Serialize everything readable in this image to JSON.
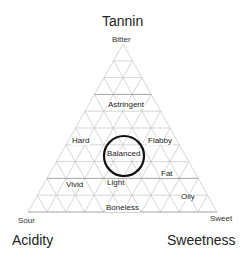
{
  "diagram": {
    "axes": {
      "top": "Tannin",
      "left": "Acidity",
      "right": "Sweetness"
    },
    "corners": {
      "top": "Bitter",
      "left": "Sour",
      "right": "Sweet"
    },
    "regions": [
      {
        "label": "Astringent"
      },
      {
        "label": "Hard"
      },
      {
        "label": "Balanced"
      },
      {
        "label": "Flabby"
      },
      {
        "label": "Fat"
      },
      {
        "label": "Vivid"
      },
      {
        "label": "Light"
      },
      {
        "label": "Oily"
      },
      {
        "label": "Boneless"
      }
    ],
    "highlight": "Balanced",
    "grid_divisions": 10,
    "colors": {
      "grid": "#bdbdbd",
      "circle": "#111111",
      "text": "#222222"
    }
  }
}
